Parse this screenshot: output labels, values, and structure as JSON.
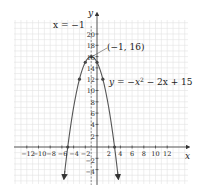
{
  "chart_data": {
    "type": "line",
    "title": "",
    "xlabel": "x",
    "ylabel": "y",
    "xlim": [
      -14,
      14
    ],
    "ylim": [
      -6,
      22
    ],
    "grid": true,
    "x_ticks": [
      -12,
      -10,
      -8,
      -6,
      -4,
      -2,
      2,
      4,
      6,
      8,
      10,
      12
    ],
    "y_ticks": [
      -4,
      -2,
      2,
      4,
      6,
      8,
      10,
      12,
      14,
      16,
      18,
      20
    ],
    "series": [
      {
        "name": "y = -x^2 - 2x + 15",
        "equation": "y = −x² − 2x + 15",
        "color": "#555555",
        "points": [
          {
            "x": -5,
            "y": 0
          },
          {
            "x": -4,
            "y": 7
          },
          {
            "x": -3,
            "y": 12
          },
          {
            "x": -2,
            "y": 15
          },
          {
            "x": -1,
            "y": 16
          },
          {
            "x": 0,
            "y": 15
          },
          {
            "x": 1,
            "y": 12
          },
          {
            "x": 2,
            "y": 7
          },
          {
            "x": 3,
            "y": 0
          }
        ],
        "marked_points": [
          {
            "x": -5,
            "y": 0
          },
          {
            "x": -3,
            "y": 12
          },
          {
            "x": -2,
            "y": 15
          },
          {
            "x": -1,
            "y": 16
          },
          {
            "x": 0,
            "y": 15
          },
          {
            "x": 1,
            "y": 12
          },
          {
            "x": 3,
            "y": 0
          }
        ]
      }
    ],
    "axis_of_symmetry": {
      "x": -1,
      "label": "x = −1",
      "style": "dashed"
    },
    "annotations": [
      {
        "text": "(−1, 16)",
        "points_to": {
          "x": -1,
          "y": 16
        }
      },
      {
        "text": "y = −x² − 2x + 15",
        "points_to": "curve"
      },
      {
        "text": "x = −1",
        "points_to": "axis_of_symmetry"
      }
    ]
  },
  "labels": {
    "x_axis": "x",
    "y_axis": "y",
    "axis_of_symmetry": "x = −1",
    "vertex": "(−1, 16)",
    "equation_lhs": "y = −x",
    "equation_exp": "2",
    "equation_rhs": " − 2x + 15",
    "xt": {
      "m12": "−12",
      "m10": "−10",
      "m8": "−8",
      "m6": "−6",
      "m4": "−4",
      "m2": "−2",
      "p2": "2",
      "p4": "4",
      "p6": "6",
      "p8": "8",
      "p10": "10",
      "p12": "12"
    },
    "yt": {
      "m4": "−4",
      "m2": "−2",
      "p2": "2",
      "p4": "4",
      "p6": "6",
      "p8": "8",
      "p10": "10",
      "p12": "12",
      "p14": "14",
      "p16": "16",
      "p18": "18",
      "p20": "20"
    }
  }
}
